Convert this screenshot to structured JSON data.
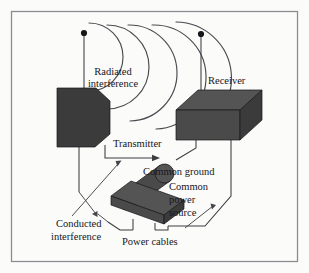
{
  "figure": {
    "background_color": "#fbfbfa",
    "frame_color": "#8a8a90",
    "solid_fill_color": "#3b3b3c",
    "line_color": "#3c3c42",
    "text_color": "#16161a"
  },
  "labels": {
    "radiated_interference_line1": "Radiated",
    "radiated_interference_line2": "interference",
    "receiver": "Receiver",
    "transmitter": "Transmitter",
    "common_ground": "Common ground",
    "common_power_source_line1": "Common",
    "common_power_source_line2": "power",
    "common_power_source_line3": "source",
    "conducted_interference_line1": "Conducted",
    "conducted_interference_line2": "interference",
    "power_cables": "Power cables"
  },
  "components": [
    {
      "name": "transmitter-box",
      "label": "Transmitter",
      "shape": "chamfered-block"
    },
    {
      "name": "receiver-box",
      "label": "Receiver",
      "shape": "isometric-block"
    },
    {
      "name": "power-cable-assembly",
      "label": "Power cables",
      "shape": "cylinder-on-slab"
    },
    {
      "name": "transmitter-antenna",
      "label": "",
      "shape": "vertical-rod-with-dot"
    },
    {
      "name": "receiver-antenna",
      "label": "",
      "shape": "vertical-rod-with-dot"
    }
  ],
  "radiated_waves": {
    "count": 5,
    "description": "concentric arcs emanating rightward from transmitter antenna"
  },
  "connections": [
    {
      "name": "transmitter-to-common-ground",
      "from": "transmitter-box",
      "to": "common-ground"
    },
    {
      "name": "receiver-to-common-ground",
      "from": "receiver-box",
      "to": "common-ground"
    },
    {
      "name": "transmitter-to-power-cables",
      "from": "transmitter-box",
      "to": "power-cable-assembly"
    },
    {
      "name": "receiver-to-power-cables",
      "from": "receiver-box",
      "to": "power-cable-assembly"
    }
  ]
}
